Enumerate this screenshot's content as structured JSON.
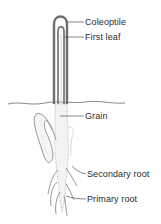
{
  "diagram": {
    "labels": [
      {
        "id": "coleoptile",
        "text": "Coleoptile"
      },
      {
        "id": "first-leaf",
        "text": "First leaf"
      },
      {
        "id": "grain",
        "text": "Grain"
      },
      {
        "id": "secondary-root",
        "text": "Secondary root"
      },
      {
        "id": "primary-root",
        "text": "Primary root"
      }
    ]
  },
  "colors": {
    "ink": "#2a2a2a",
    "sheath": "#6e6e6e",
    "stipple": "#9a9a9a",
    "background": "#ffffff"
  }
}
